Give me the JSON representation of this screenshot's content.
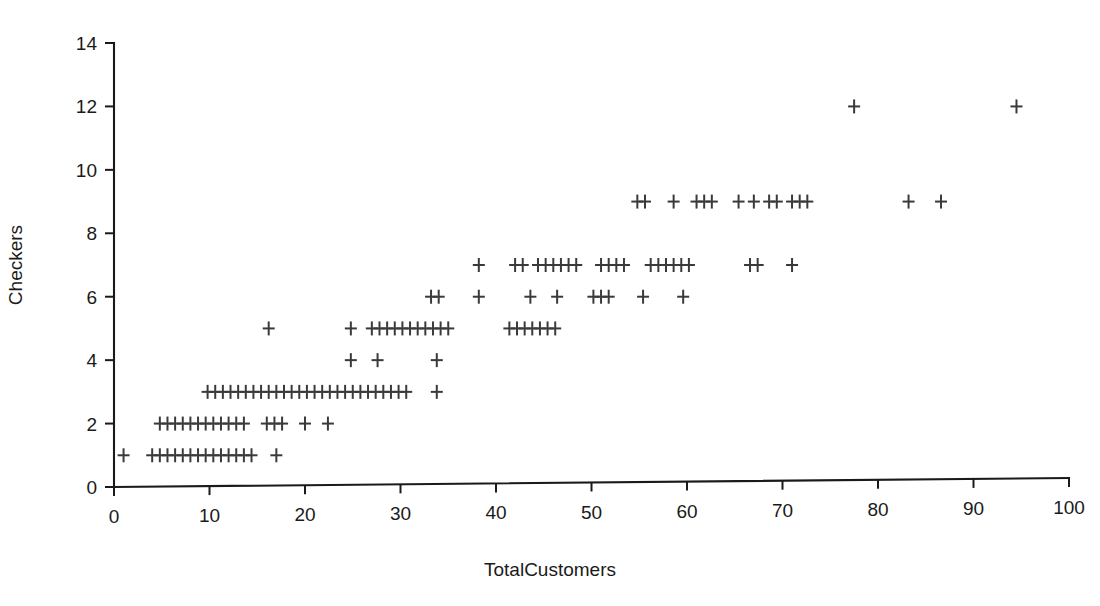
{
  "chart_data": {
    "type": "scatter",
    "title": "",
    "xlabel": "TotalCustomers",
    "ylabel": "Checkers",
    "xlim": [
      0,
      100
    ],
    "ylim": [
      0,
      14
    ],
    "xticks": [
      0,
      10,
      20,
      30,
      40,
      50,
      60,
      70,
      80,
      90,
      100
    ],
    "yticks": [
      0,
      2,
      4,
      6,
      8,
      10,
      12,
      14
    ],
    "xtick_labels": [
      "0",
      "10",
      "20",
      "30",
      "40",
      "50",
      "60",
      "70",
      "80",
      "90",
      "100"
    ],
    "ytick_labels": [
      "0",
      "2",
      "4",
      "6",
      "8",
      "10",
      "12",
      "14"
    ],
    "grid": false,
    "legend": false,
    "marker": "plus",
    "marker_color": "#3a3a3a",
    "points": [
      {
        "x": 1.0,
        "y": 1
      },
      {
        "x": 4.0,
        "y": 1
      },
      {
        "x": 4.8,
        "y": 1
      },
      {
        "x": 5.6,
        "y": 1
      },
      {
        "x": 6.4,
        "y": 1
      },
      {
        "x": 7.2,
        "y": 1
      },
      {
        "x": 8.0,
        "y": 1
      },
      {
        "x": 8.8,
        "y": 1
      },
      {
        "x": 9.6,
        "y": 1
      },
      {
        "x": 10.4,
        "y": 1
      },
      {
        "x": 11.2,
        "y": 1
      },
      {
        "x": 12.0,
        "y": 1
      },
      {
        "x": 12.8,
        "y": 1
      },
      {
        "x": 13.6,
        "y": 1
      },
      {
        "x": 14.4,
        "y": 1
      },
      {
        "x": 17.0,
        "y": 1
      },
      {
        "x": 4.8,
        "y": 2
      },
      {
        "x": 5.6,
        "y": 2
      },
      {
        "x": 6.4,
        "y": 2
      },
      {
        "x": 7.2,
        "y": 2
      },
      {
        "x": 8.0,
        "y": 2
      },
      {
        "x": 8.8,
        "y": 2
      },
      {
        "x": 9.6,
        "y": 2
      },
      {
        "x": 10.4,
        "y": 2
      },
      {
        "x": 11.2,
        "y": 2
      },
      {
        "x": 12.0,
        "y": 2
      },
      {
        "x": 12.8,
        "y": 2
      },
      {
        "x": 13.6,
        "y": 2
      },
      {
        "x": 16.0,
        "y": 2
      },
      {
        "x": 16.8,
        "y": 2
      },
      {
        "x": 17.6,
        "y": 2
      },
      {
        "x": 20.0,
        "y": 2
      },
      {
        "x": 22.4,
        "y": 2
      },
      {
        "x": 9.8,
        "y": 3
      },
      {
        "x": 10.6,
        "y": 3
      },
      {
        "x": 11.4,
        "y": 3
      },
      {
        "x": 12.2,
        "y": 3
      },
      {
        "x": 13.0,
        "y": 3
      },
      {
        "x": 13.8,
        "y": 3
      },
      {
        "x": 14.6,
        "y": 3
      },
      {
        "x": 15.4,
        "y": 3
      },
      {
        "x": 16.2,
        "y": 3
      },
      {
        "x": 17.0,
        "y": 3
      },
      {
        "x": 17.8,
        "y": 3
      },
      {
        "x": 18.6,
        "y": 3
      },
      {
        "x": 19.4,
        "y": 3
      },
      {
        "x": 20.2,
        "y": 3
      },
      {
        "x": 21.0,
        "y": 3
      },
      {
        "x": 21.8,
        "y": 3
      },
      {
        "x": 22.6,
        "y": 3
      },
      {
        "x": 23.4,
        "y": 3
      },
      {
        "x": 24.2,
        "y": 3
      },
      {
        "x": 25.0,
        "y": 3
      },
      {
        "x": 25.8,
        "y": 3
      },
      {
        "x": 26.6,
        "y": 3
      },
      {
        "x": 27.4,
        "y": 3
      },
      {
        "x": 28.2,
        "y": 3
      },
      {
        "x": 29.0,
        "y": 3
      },
      {
        "x": 29.8,
        "y": 3
      },
      {
        "x": 30.6,
        "y": 3
      },
      {
        "x": 33.8,
        "y": 3
      },
      {
        "x": 24.8,
        "y": 4
      },
      {
        "x": 27.6,
        "y": 4
      },
      {
        "x": 33.8,
        "y": 4
      },
      {
        "x": 16.2,
        "y": 5
      },
      {
        "x": 24.8,
        "y": 5
      },
      {
        "x": 27.0,
        "y": 5
      },
      {
        "x": 27.8,
        "y": 5
      },
      {
        "x": 28.6,
        "y": 5
      },
      {
        "x": 29.4,
        "y": 5
      },
      {
        "x": 30.2,
        "y": 5
      },
      {
        "x": 31.0,
        "y": 5
      },
      {
        "x": 31.8,
        "y": 5
      },
      {
        "x": 32.6,
        "y": 5
      },
      {
        "x": 33.4,
        "y": 5
      },
      {
        "x": 34.2,
        "y": 5
      },
      {
        "x": 35.0,
        "y": 5
      },
      {
        "x": 41.4,
        "y": 5
      },
      {
        "x": 42.2,
        "y": 5
      },
      {
        "x": 43.0,
        "y": 5
      },
      {
        "x": 43.8,
        "y": 5
      },
      {
        "x": 44.6,
        "y": 5
      },
      {
        "x": 45.4,
        "y": 5
      },
      {
        "x": 46.2,
        "y": 5
      },
      {
        "x": 33.2,
        "y": 6
      },
      {
        "x": 34.0,
        "y": 6
      },
      {
        "x": 38.2,
        "y": 6
      },
      {
        "x": 43.6,
        "y": 6
      },
      {
        "x": 46.4,
        "y": 6
      },
      {
        "x": 50.2,
        "y": 6
      },
      {
        "x": 51.0,
        "y": 6
      },
      {
        "x": 51.8,
        "y": 6
      },
      {
        "x": 55.4,
        "y": 6
      },
      {
        "x": 59.6,
        "y": 6
      },
      {
        "x": 38.2,
        "y": 7
      },
      {
        "x": 42.0,
        "y": 7
      },
      {
        "x": 42.8,
        "y": 7
      },
      {
        "x": 44.4,
        "y": 7
      },
      {
        "x": 45.2,
        "y": 7
      },
      {
        "x": 46.0,
        "y": 7
      },
      {
        "x": 46.8,
        "y": 7
      },
      {
        "x": 47.6,
        "y": 7
      },
      {
        "x": 48.4,
        "y": 7
      },
      {
        "x": 51.0,
        "y": 7
      },
      {
        "x": 51.8,
        "y": 7
      },
      {
        "x": 52.6,
        "y": 7
      },
      {
        "x": 53.4,
        "y": 7
      },
      {
        "x": 56.2,
        "y": 7
      },
      {
        "x": 57.0,
        "y": 7
      },
      {
        "x": 57.8,
        "y": 7
      },
      {
        "x": 58.6,
        "y": 7
      },
      {
        "x": 59.4,
        "y": 7
      },
      {
        "x": 60.2,
        "y": 7
      },
      {
        "x": 66.6,
        "y": 7
      },
      {
        "x": 67.4,
        "y": 7
      },
      {
        "x": 71.0,
        "y": 7
      },
      {
        "x": 54.8,
        "y": 9
      },
      {
        "x": 55.6,
        "y": 9
      },
      {
        "x": 58.6,
        "y": 9
      },
      {
        "x": 61.0,
        "y": 9
      },
      {
        "x": 61.8,
        "y": 9
      },
      {
        "x": 62.6,
        "y": 9
      },
      {
        "x": 65.4,
        "y": 9
      },
      {
        "x": 67.0,
        "y": 9
      },
      {
        "x": 68.6,
        "y": 9
      },
      {
        "x": 69.4,
        "y": 9
      },
      {
        "x": 71.0,
        "y": 9
      },
      {
        "x": 71.8,
        "y": 9
      },
      {
        "x": 72.6,
        "y": 9
      },
      {
        "x": 83.2,
        "y": 9
      },
      {
        "x": 86.6,
        "y": 9
      },
      {
        "x": 77.5,
        "y": 12
      },
      {
        "x": 94.5,
        "y": 12
      }
    ]
  },
  "axes": {
    "x_axis_name": "x-axis",
    "y_axis_name": "y-axis"
  }
}
